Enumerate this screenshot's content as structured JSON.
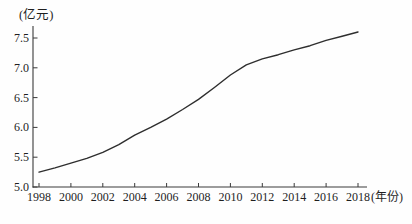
{
  "chart": {
    "y_unit_label": "(亿元)",
    "x_unit_label": "(年份)",
    "line_color": "#2e2e2e",
    "axis_color": "#3a3a3a",
    "text_color": "#1f1f1f"
  },
  "chart_data": {
    "type": "line",
    "title": "",
    "xlabel": "(年份)",
    "ylabel": "(亿元)",
    "xlim": [
      1998,
      2018
    ],
    "ylim": [
      5.0,
      7.5
    ],
    "grid": false,
    "legend": "none",
    "x_ticks": [
      1998,
      2000,
      2002,
      2004,
      2006,
      2008,
      2010,
      2012,
      2014,
      2016,
      2018
    ],
    "x_tick_labels": [
      "1998",
      "2000",
      "2002",
      "2004",
      "2006",
      "2008",
      "2010",
      "2012",
      "2014",
      "2016",
      "2018"
    ],
    "y_ticks": [
      5.0,
      5.5,
      6.0,
      6.5,
      7.0,
      7.5
    ],
    "y_tick_labels": [
      "5.0",
      "5.5",
      "6.0",
      "6.5",
      "7.0",
      "7.5"
    ],
    "series": [
      {
        "name": "value",
        "x": [
          1998,
          1999,
          2000,
          2001,
          2002,
          2003,
          2004,
          2005,
          2006,
          2007,
          2008,
          2009,
          2010,
          2011,
          2012,
          2013,
          2014,
          2015,
          2016,
          2017,
          2018
        ],
        "y": [
          5.25,
          5.32,
          5.4,
          5.48,
          5.58,
          5.71,
          5.87,
          6.0,
          6.14,
          6.3,
          6.47,
          6.67,
          6.88,
          7.05,
          7.15,
          7.22,
          7.3,
          7.37,
          7.46,
          7.53,
          7.6
        ]
      }
    ]
  }
}
